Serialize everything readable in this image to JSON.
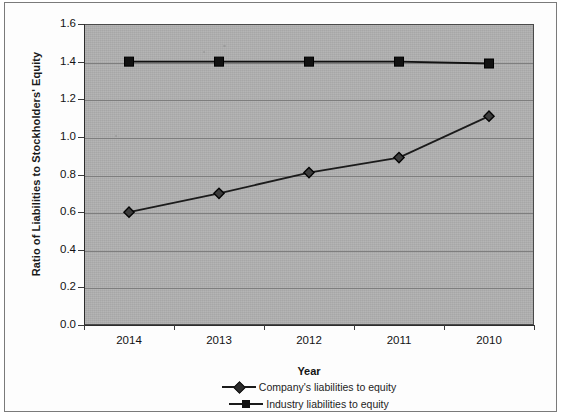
{
  "chart_data": {
    "type": "line",
    "title": "",
    "xlabel": "Year",
    "ylabel": "Ratio of Liabilities to Stockholders' Equity",
    "categories": [
      "2014",
      "2013",
      "2012",
      "2011",
      "2010"
    ],
    "ylim": [
      0.0,
      1.6
    ],
    "ytick_labels": [
      "0.0",
      "0.2",
      "0.4",
      "0.6",
      "0.8",
      "1.0",
      "1.2",
      "1.4",
      "1.6"
    ],
    "ytick_values": [
      0.0,
      0.2,
      0.4,
      0.6,
      0.8,
      1.0,
      1.2,
      1.4,
      1.6
    ],
    "grid": true,
    "legend_position": "bottom",
    "plot_background": "#b0b0b0",
    "series": [
      {
        "name": "Company's liabilities to equity",
        "marker": "diamond",
        "color": "#1b1b1b",
        "values": [
          0.6,
          0.7,
          0.81,
          0.89,
          1.11
        ]
      },
      {
        "name": "Industry liabilities to equity",
        "marker": "square",
        "color": "#111111",
        "values": [
          1.4,
          1.4,
          1.4,
          1.4,
          1.39
        ]
      }
    ]
  },
  "axes": {
    "y_title": "Ratio of Liabilities to Stockholders' Equity",
    "x_title": "Year"
  },
  "legend": {
    "items": [
      {
        "label": "Company's liabilities to equity",
        "marker": "diamond"
      },
      {
        "label": "Industry liabilities to equity",
        "marker": "square"
      }
    ]
  }
}
